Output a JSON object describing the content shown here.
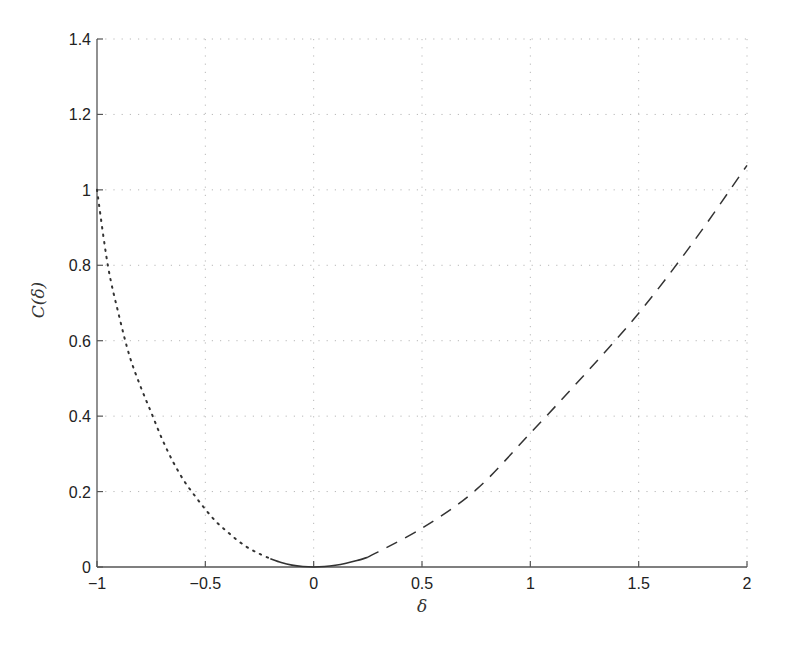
{
  "chart_data": {
    "type": "line",
    "title": "",
    "xlabel": "δ",
    "ylabel": "C(δ)",
    "xlim": [
      -1,
      2
    ],
    "ylim": [
      0,
      1.4
    ],
    "grid": true,
    "legend": null,
    "x_ticks": [
      -1,
      -0.5,
      0,
      0.5,
      1,
      1.5,
      2
    ],
    "x_tick_labels": [
      "−1",
      "−0.5",
      "0",
      "0.5",
      "1",
      "1.5",
      "2"
    ],
    "y_ticks": [
      0,
      0.2,
      0.4,
      0.6,
      0.8,
      1,
      1.2,
      1.4
    ],
    "y_tick_labels": [
      "0",
      "0.2",
      "0.4",
      "0.6",
      "0.8",
      "1",
      "1.2",
      "1.4"
    ],
    "series": [
      {
        "name": "dotted (δ < -0.2)",
        "style": "dotted",
        "x": [
          -1.0,
          -0.95,
          -0.9,
          -0.85,
          -0.8,
          -0.75,
          -0.7,
          -0.65,
          -0.6,
          -0.55,
          -0.5,
          -0.45,
          -0.4,
          -0.35,
          -0.3,
          -0.25,
          -0.2
        ],
        "y": [
          1.0,
          0.8,
          0.67,
          0.56,
          0.48,
          0.41,
          0.34,
          0.28,
          0.23,
          0.19,
          0.153,
          0.12,
          0.094,
          0.07,
          0.05,
          0.035,
          0.022
        ]
      },
      {
        "name": "solid (-0.2 ≤ δ ≤ 0.25)",
        "style": "solid",
        "x": [
          -0.2,
          -0.15,
          -0.1,
          -0.05,
          0,
          0.05,
          0.1,
          0.15,
          0.2,
          0.25
        ],
        "y": [
          0.022,
          0.012,
          0.005,
          0.0013,
          0,
          0.0012,
          0.0046,
          0.01,
          0.017,
          0.026
        ]
      },
      {
        "name": "dashed (δ > 0.25)",
        "style": "dashed",
        "x": [
          0.25,
          0.5,
          0.75,
          1.0,
          1.25,
          1.5,
          1.75,
          2.0
        ],
        "y": [
          0.026,
          0.103,
          0.205,
          0.355,
          0.51,
          0.673,
          0.86,
          1.065
        ]
      }
    ]
  }
}
